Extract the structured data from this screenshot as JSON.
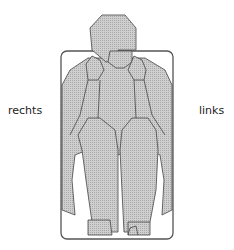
{
  "diagram": {
    "type": "figure-outline-front-view",
    "labels": {
      "right_side": "rechts",
      "left_side": "links"
    },
    "colors": {
      "figure_fill": "#c8c8c8",
      "outline": "#444444",
      "frame": "#555555"
    }
  }
}
